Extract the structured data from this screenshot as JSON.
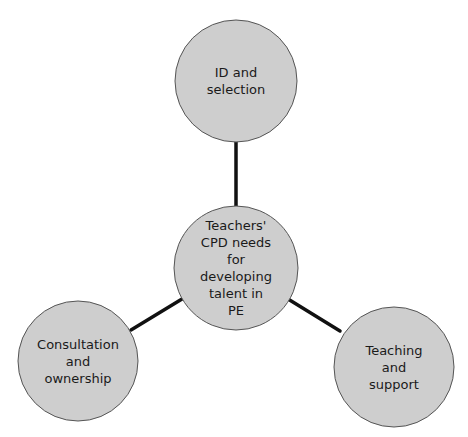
{
  "diagram": {
    "type": "hub-and-spoke",
    "colors": {
      "node_fill": "#cecece",
      "node_stroke": "#555555",
      "connector": "#111111"
    },
    "center": {
      "lines": [
        "Teachers'",
        "CPD needs",
        "for",
        "developing",
        "talent in",
        "PE"
      ],
      "cx": 236,
      "cy": 268,
      "r": 62
    },
    "nodes": [
      {
        "id": "top",
        "lines": [
          "ID and",
          "selection"
        ],
        "cx": 236,
        "cy": 81,
        "r": 61
      },
      {
        "id": "left",
        "lines": [
          "Consultation",
          "and",
          "ownership"
        ],
        "cx": 78,
        "cy": 361,
        "r": 60
      },
      {
        "id": "right",
        "lines": [
          "Teaching",
          "and",
          "support"
        ],
        "cx": 394,
        "cy": 367,
        "r": 60
      }
    ],
    "connectors": [
      {
        "from": "center",
        "to": "top",
        "x1": 236,
        "y1": 206,
        "x2": 236,
        "y2": 142
      },
      {
        "from": "center",
        "to": "left",
        "x1": 182,
        "y1": 299,
        "x2": 131,
        "y2": 330
      },
      {
        "from": "center",
        "to": "right",
        "x1": 288,
        "y1": 299,
        "x2": 340,
        "y2": 331
      }
    ]
  }
}
